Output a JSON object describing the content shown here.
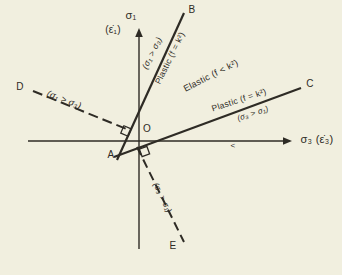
{
  "figure": {
    "colors": {
      "background": "#f1efdf",
      "ink": "#2e2b25"
    },
    "axes": {
      "y_axis": {
        "symbol": "σ₁",
        "rate": "(ε̇₁)"
      },
      "x_axis": {
        "label": "σ₃ (ε̇₃)"
      },
      "direction_mark": "<"
    },
    "points": {
      "origin": "O",
      "apex": "A"
    },
    "lines": {
      "B": {
        "label": "B",
        "style": "solid",
        "annotations": [
          "(σ₁ > σ₃)",
          "Plastic (f = k²)"
        ]
      },
      "C": {
        "label": "C",
        "style": "solid",
        "annotations": [
          "Plastic (f = k²)",
          "(σ₃ > σ₁)"
        ]
      },
      "D": {
        "label": "D",
        "style": "dashed",
        "annotations": [
          "(σ₁ > σ₃)"
        ]
      },
      "E": {
        "label": "E",
        "style": "dashed",
        "annotations": [
          "(σ₃ > σ₁)"
        ]
      }
    },
    "regions": {
      "elastic": "Elastic (f < k²)"
    }
  }
}
